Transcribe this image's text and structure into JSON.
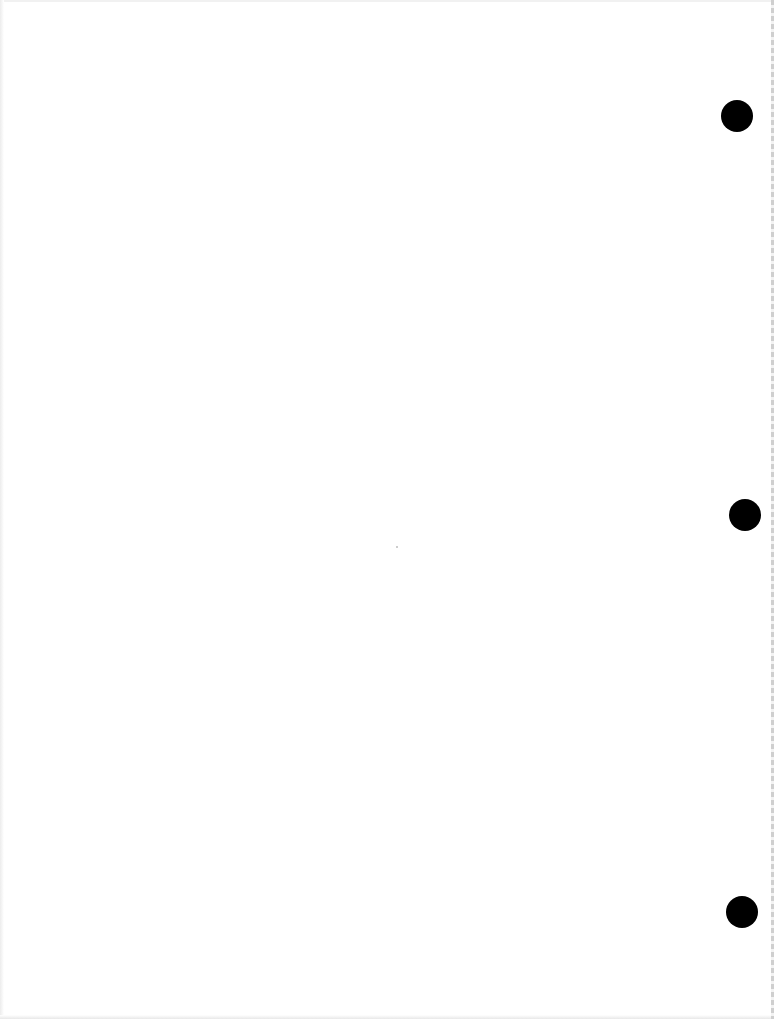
{
  "page": {
    "type": "blank scanned sheet",
    "background_color": "#ffffff",
    "width": 774,
    "height": 1019
  },
  "punch_holes": [
    {
      "cx": 737,
      "cy": 116,
      "r": 16,
      "color": "#000000"
    },
    {
      "cx": 745,
      "cy": 515,
      "r": 16,
      "color": "#000000"
    },
    {
      "cx": 742,
      "cy": 912,
      "r": 16,
      "color": "#000000"
    }
  ],
  "specks": [
    {
      "x": 396,
      "y": 546
    }
  ]
}
